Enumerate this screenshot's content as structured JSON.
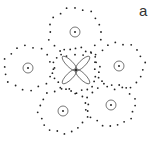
{
  "figure": {
    "panel_label": "a",
    "colors": {
      "stroke": "#555555",
      "dot": "#222222",
      "background": "#ffffff"
    },
    "central_cell": {
      "name": "center",
      "petal_count": 4
    },
    "neighbor_cells": [
      {
        "name": "top"
      },
      {
        "name": "left"
      },
      {
        "name": "right"
      },
      {
        "name": "bottom-left"
      },
      {
        "name": "bottom-right"
      }
    ]
  }
}
